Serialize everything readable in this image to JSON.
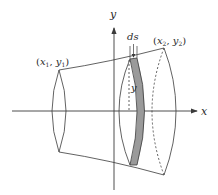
{
  "diagram": {
    "labels": {
      "x_axis": "x",
      "y_axis": "y",
      "point1": "(x₁, y₁)",
      "point1_parts": {
        "open": "(",
        "x": "x",
        "xsub": "1",
        "sep": ", ",
        "y": "y",
        "ysub": "1",
        "close": ")"
      },
      "point2_parts": {
        "open": "(",
        "x": "x",
        "xsub": "2",
        "sep": ", ",
        "y": "y",
        "ysub": "2",
        "close": ")"
      },
      "arc_element": "ds",
      "radius": "y"
    },
    "colors": {
      "stroke": "#3a3a3a",
      "strip_fill": "#9a9a9a",
      "background": "#ffffff"
    }
  }
}
